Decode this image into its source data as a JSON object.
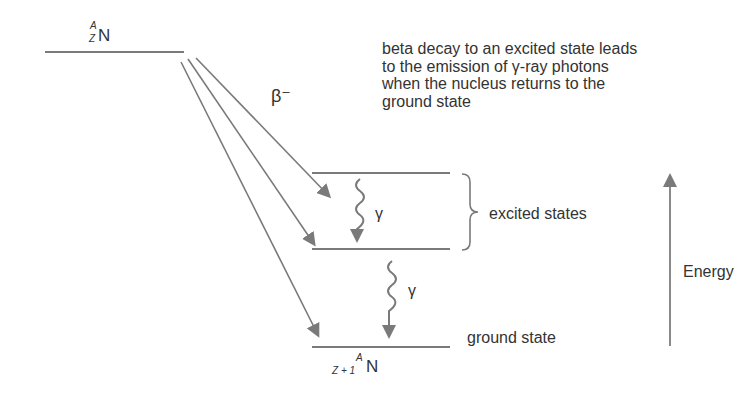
{
  "diagram": {
    "title_caption": [
      "beta decay to an excited state leads",
      "to the emission of γ-ray photons",
      "when the nucleus returns to the",
      "ground state"
    ],
    "parent_nuclide": {
      "symbol": "N",
      "mass_number": "A",
      "atomic_number": "Z"
    },
    "daughter_nuclide": {
      "symbol": "N",
      "mass_number": "A",
      "atomic_number": "Z + 1"
    },
    "decay_label": "β⁻",
    "gamma_label_1": "γ",
    "gamma_label_2": "γ",
    "excited_states_label": "excited states",
    "ground_state_label": "ground state",
    "energy_axis_label": "Energy",
    "colors": {
      "lines": "#7a7a7a",
      "text": "#333333",
      "background": "#ffffff"
    }
  }
}
